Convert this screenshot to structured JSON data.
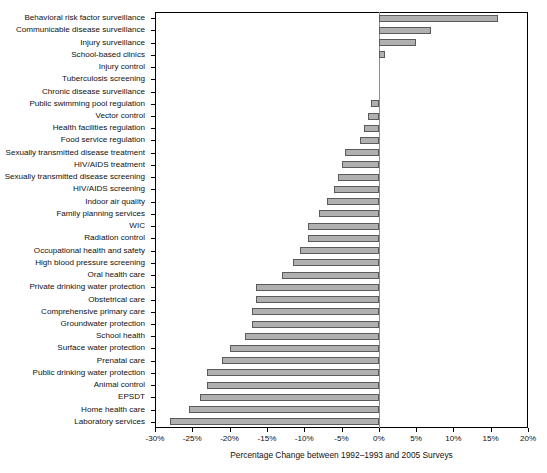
{
  "chart_data": {
    "type": "bar",
    "orientation": "horizontal",
    "title": "",
    "subtitle": "",
    "xlabel": "Percentage Change between 1992–1993 and 2005 Surveys",
    "ylabel": "",
    "xlim": [
      -30,
      20
    ],
    "ylim": null,
    "grid": false,
    "legend": null,
    "xticks": [
      -30,
      -25,
      -20,
      -15,
      -10,
      -5,
      0,
      5,
      10,
      15,
      20
    ],
    "xticklabels": [
      "-30%",
      "-25%",
      "-20%",
      "-15%",
      "-10%",
      "-5%",
      "0%",
      "5%",
      "10%",
      "15%",
      "20%"
    ],
    "zero_reference_line": 0,
    "bar_fill_color": "#b0b0b0",
    "bar_edge_color": "#5a5a5a",
    "categories": [
      "Behavioral risk factor surveillance",
      "Communicable disease surveillance",
      "Injury surveillance",
      "School-based clinics",
      "Injury control",
      "Tuberculosis screening",
      "Chronic disease surveillance",
      "Public swimming pool regulation",
      "Vector control",
      "Health facilities regulation",
      "Food service regulation",
      "Sexually transmitted disease treatment",
      "HIV/AIDS treatment",
      "Sexually transmitted disease screening",
      "HIV/AIDS screening",
      "Indoor air quality",
      "Family planning services",
      "WIC",
      "Radiation control",
      "Occupational health and safety",
      "High blood pressure screening",
      "Oral health care",
      "Private drinking water protection",
      "Obstetrical care",
      "Comprehensive primary care",
      "Groundwater protection",
      "School health",
      "Surface water protection",
      "Prenatal care",
      "Public drinking water protection",
      "Animal control",
      "EPSDT",
      "Home health care",
      "Laboratory services"
    ],
    "values": [
      16.0,
      7.0,
      5.0,
      0.8,
      0.0,
      0.0,
      0.0,
      -1.0,
      -1.5,
      -2.0,
      -2.5,
      -4.5,
      -5.0,
      -5.5,
      -6.0,
      -7.0,
      -8.0,
      -9.5,
      -9.5,
      -10.5,
      -11.5,
      -13.0,
      -16.5,
      -16.5,
      -17.0,
      -17.0,
      -18.0,
      -20.0,
      -21.0,
      -23.0,
      -23.0,
      -24.0,
      -25.5,
      -28.0
    ]
  }
}
